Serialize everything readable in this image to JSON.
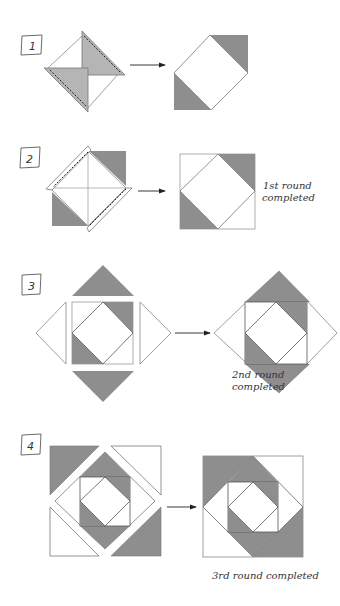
{
  "colors": {
    "gray": "#a8a8a8",
    "dark_gray": "#8e8e8e",
    "line": "#777777",
    "white": "#ffffff"
  },
  "steps": [
    {
      "number": "1",
      "caption": ""
    },
    {
      "number": "2",
      "caption_line1": "1st round",
      "caption_line2": "completed"
    },
    {
      "number": "3",
      "caption_line1": "2nd round",
      "caption_line2": "completed"
    },
    {
      "number": "4",
      "caption": "3rd round completed"
    }
  ]
}
